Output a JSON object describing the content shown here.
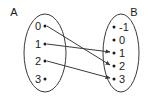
{
  "diagram": {
    "type": "mapping-diagram",
    "title": "",
    "domain_set": {
      "name": "A",
      "label_x": 14,
      "label_y": 16,
      "ellipse": {
        "cx": 45,
        "cy": 53,
        "rx": 21,
        "ry": 39
      },
      "elements": [
        {
          "value": "0",
          "text_x": 38,
          "text_y": 30,
          "dot_x": 44,
          "dot_y": 26
        },
        {
          "value": "1",
          "text_x": 38,
          "text_y": 48,
          "dot_x": 44,
          "dot_y": 44
        },
        {
          "value": "2",
          "text_x": 38,
          "text_y": 65,
          "dot_x": 44,
          "dot_y": 61
        },
        {
          "value": "3",
          "text_x": 38,
          "text_y": 83,
          "dot_x": 44,
          "dot_y": 79
        }
      ]
    },
    "codomain_set": {
      "name": "B",
      "label_x": 134,
      "label_y": 16,
      "ellipse": {
        "cx": 121,
        "cy": 53,
        "rx": 18,
        "ry": 39
      },
      "elements": [
        {
          "value": "-1",
          "text_x": 120,
          "text_y": 31,
          "dot_x": 115,
          "dot_y": 27
        },
        {
          "value": "0",
          "text_x": 120,
          "text_y": 44,
          "dot_x": 115,
          "dot_y": 40
        },
        {
          "value": "1",
          "text_x": 120,
          "text_y": 57,
          "dot_x": 115,
          "dot_y": 53
        },
        {
          "value": "2",
          "text_x": 120,
          "text_y": 70,
          "dot_x": 115,
          "dot_y": 66
        },
        {
          "value": "3",
          "text_x": 120,
          "text_y": 83,
          "dot_x": 115,
          "dot_y": 79
        }
      ]
    },
    "arrows": [
      {
        "from": "0",
        "to": "2",
        "x1": 47,
        "y1": 26,
        "x2": 112,
        "y2": 66
      },
      {
        "from": "1",
        "to": "1",
        "x1": 47,
        "y1": 44,
        "x2": 112,
        "y2": 53
      },
      {
        "from": "2",
        "to": "3",
        "x1": 47,
        "y1": 61,
        "x2": 112,
        "y2": 79
      }
    ],
    "unmapped_elements": [
      "3"
    ],
    "colors": {
      "stroke": "#3a3a3a",
      "text": "#1a1a1a",
      "background": "#ffffff"
    }
  }
}
